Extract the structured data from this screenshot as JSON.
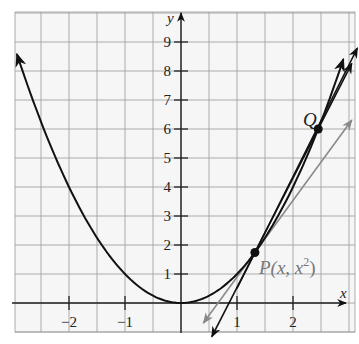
{
  "chart_data": {
    "type": "line",
    "title": "",
    "xlabel": "x",
    "ylabel": "y",
    "xlim": [
      -2.95,
      3.1
    ],
    "ylim": [
      -1.05,
      10.0
    ],
    "grid": true,
    "grid_x_step": 0.5,
    "grid_y_step": 1,
    "x_ticks": [
      -2,
      -1,
      1,
      2
    ],
    "x_tick_labels": [
      "−2",
      "−1",
      "1",
      "2"
    ],
    "y_ticks": [
      1,
      2,
      3,
      4,
      5,
      6,
      7,
      8,
      9
    ],
    "y_tick_labels": [
      "1",
      "2",
      "3",
      "4",
      "5",
      "6",
      "7",
      "8",
      "9"
    ],
    "series": [
      {
        "name": "y = x^2 (parabola)",
        "color": "#111111",
        "function": "x^2",
        "x_range": [
          -2.93,
          2.9
        ]
      },
      {
        "name": "secant line PQ",
        "color": "#111111",
        "through": [
          [
            1.32,
            1.74
          ],
          [
            2.45,
            6.0
          ]
        ]
      },
      {
        "name": "secant line (steeper)",
        "color": "#111111",
        "through": [
          [
            1.32,
            1.74
          ],
          [
            3.1,
            8.6
          ]
        ]
      },
      {
        "name": "tangent line at P",
        "color": "#808080",
        "through": [
          [
            1.32,
            1.74
          ]
        ],
        "slope": 2.64
      }
    ],
    "points": [
      {
        "label": "P",
        "text": "P(x, x²)",
        "x": 1.32,
        "y": 1.74,
        "label_color": "#777777"
      },
      {
        "label": "Q",
        "text": "Q",
        "x": 2.45,
        "y": 6.0,
        "label_color": "#222222"
      }
    ]
  },
  "labels": {
    "x_axis": "x",
    "y_axis": "y",
    "point_q": "Q",
    "point_p_main": "P(x, x",
    "point_p_sup": "2",
    "point_p_close": ")"
  }
}
